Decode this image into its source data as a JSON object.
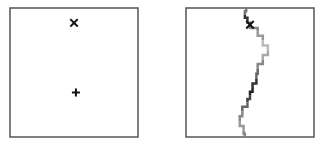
{
  "colors": {
    "frame": "#555555",
    "marker": "#111111",
    "path_shades": [
      "#777777",
      "#333333",
      "#666666",
      "#888888",
      "#999999",
      "#bbbbbb",
      "#aaaaaa",
      "#888888",
      "#666666",
      "#333333",
      "#222222",
      "#444444",
      "#666666",
      "#888888",
      "#999999",
      "#888888"
    ]
  },
  "panels": [
    {
      "name": "left-panel",
      "markers": [
        {
          "type": "cross-x",
          "label": "start-marker",
          "pos": [
            0.5,
            0.115
          ]
        },
        {
          "type": "plus",
          "label": "goal-marker",
          "pos": [
            0.515,
            0.655
          ]
        }
      ]
    },
    {
      "name": "right-panel",
      "markers": [
        {
          "type": "cross-x",
          "label": "start-marker",
          "pos": [
            0.5,
            0.13
          ]
        }
      ],
      "path": [
        [
          0.47,
          0.0
        ],
        [
          0.46,
          0.05
        ],
        [
          0.48,
          0.1
        ],
        [
          0.5,
          0.13
        ],
        [
          0.56,
          0.18
        ],
        [
          0.6,
          0.25
        ],
        [
          0.64,
          0.33
        ],
        [
          0.6,
          0.4
        ],
        [
          0.56,
          0.47
        ],
        [
          0.55,
          0.55
        ],
        [
          0.52,
          0.62
        ],
        [
          0.5,
          0.68
        ],
        [
          0.48,
          0.73
        ],
        [
          0.44,
          0.8
        ],
        [
          0.42,
          0.88
        ],
        [
          0.45,
          0.95
        ],
        [
          0.46,
          1.0
        ]
      ]
    }
  ]
}
